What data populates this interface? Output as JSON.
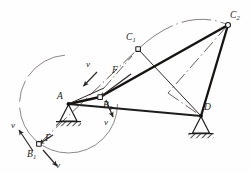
{
  "figure": {
    "background_color": "#fefefe",
    "line_color": "#1d1d1d",
    "thin_line_color": "#55514f",
    "labels": {
      "point_a": "A",
      "point_b1": "B",
      "point_b1_sub": "1",
      "point_b2": "B",
      "point_b2_sub": "2",
      "point_c1": "C",
      "point_c1_sub": "1",
      "point_c2": "C",
      "point_c2_sub": "2",
      "point_d": "D",
      "force_upper": "F",
      "force_lower": "F",
      "velocity_top": "v",
      "velocity_mid": "v",
      "velocity_left": "v",
      "velocity_bottom": "v"
    },
    "geometry": {
      "A": [
        68.5,
        104.0
      ],
      "B1": [
        39.0,
        144.0
      ],
      "B2": [
        100.0,
        97.0
      ],
      "C1": [
        138.0,
        49.0
      ],
      "C2": [
        228.0,
        25.0
      ],
      "D": [
        201.0,
        116.0
      ],
      "crank_radius": 49.0
    },
    "elements": {
      "crank_circle": "path of crank pin B about fixed centre A",
      "coupler_arc": "dash-dot arc swept by coupler point C from C1 to C2",
      "ground_support_a": "fixed pin support at A",
      "ground_support_d": "fixed pin support at D",
      "link_ab": "crank A-B2",
      "link_bc": "coupler B2-C2",
      "link_cd": "rocker C2-D",
      "link_ad": "fixed frame A-D",
      "phantom_b1c1": "dash-dot link B1-C1 (first position)",
      "phantom_c1d": "link C1-D (first position)",
      "phantom_c2d_diagonal": "dash-dot diagonal C2-D"
    }
  }
}
